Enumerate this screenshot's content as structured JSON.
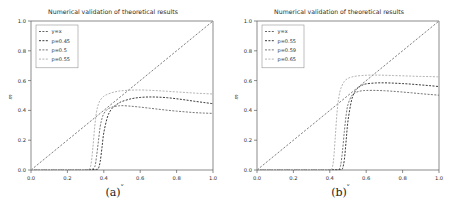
{
  "figure": {
    "panels": [
      {
        "id": "panel-a",
        "caption": "(a)",
        "title": "Numerical validation of theoretical results",
        "xlabel": "x",
        "ylabel": "m"
      },
      {
        "id": "panel-b",
        "caption": "(b)",
        "title": "Numerical validation of theoretical results",
        "xlabel": "x",
        "ylabel": "m"
      }
    ]
  },
  "axis": {
    "xticks": [
      "0.0",
      "0.2",
      "0.4",
      "0.6",
      "0.8",
      "1.0"
    ],
    "yticks": [
      "0.0",
      "0.2",
      "0.4",
      "0.6",
      "0.8",
      "1.0"
    ],
    "xlim": [
      0.0,
      1.0
    ],
    "ylim": [
      0.0,
      1.0
    ]
  },
  "colors": {
    "identity": "#555555",
    "series_dark": "#222222",
    "series_mid": "#666666",
    "series_light": "#aaaaaa",
    "spine": "#5a5a5a",
    "text": "#2b2b2b",
    "background": "#ffffff"
  },
  "chart_data": [
    {
      "type": "line",
      "title": "Numerical validation of theoretical results",
      "xlabel": "x",
      "ylabel": "m",
      "xlim": [
        0.0,
        1.0
      ],
      "ylim": [
        0.0,
        1.0
      ],
      "grid": false,
      "legend_position": "upper left",
      "xticks": [
        0.0,
        0.2,
        0.4,
        0.6,
        0.8,
        1.0
      ],
      "yticks": [
        0.0,
        0.2,
        0.4,
        0.6,
        0.8,
        1.0
      ],
      "series": [
        {
          "name": "y=x",
          "style": "dashed",
          "color": "#555555",
          "x": [
            0.0,
            1.0
          ],
          "y": [
            0.0,
            1.0
          ]
        },
        {
          "name": "p=0.45",
          "style": "dashed",
          "color": "#222222",
          "x": [
            0.0,
            0.05,
            0.1,
            0.15,
            0.2,
            0.25,
            0.3,
            0.34,
            0.36,
            0.37,
            0.38,
            0.39,
            0.4,
            0.42,
            0.44,
            0.46,
            0.48,
            0.5,
            0.55,
            0.6,
            0.65,
            0.7,
            0.75,
            0.8,
            0.85,
            0.9,
            0.95,
            1.0
          ],
          "y": [
            0.003,
            0.003,
            0.003,
            0.003,
            0.003,
            0.003,
            0.003,
            0.003,
            0.004,
            0.01,
            0.055,
            0.15,
            0.25,
            0.355,
            0.405,
            0.43,
            0.447,
            0.46,
            0.478,
            0.487,
            0.49,
            0.489,
            0.485,
            0.478,
            0.47,
            0.461,
            0.453,
            0.445
          ]
        },
        {
          "name": "p=0.5",
          "style": "dashed",
          "color": "#666666",
          "x": [
            0.0,
            0.05,
            0.1,
            0.15,
            0.2,
            0.25,
            0.3,
            0.33,
            0.35,
            0.36,
            0.37,
            0.38,
            0.39,
            0.4,
            0.42,
            0.44,
            0.46,
            0.48,
            0.5,
            0.55,
            0.6,
            0.65,
            0.7,
            0.75,
            0.8,
            0.85,
            0.9,
            0.95,
            1.0
          ],
          "y": [
            0.003,
            0.003,
            0.003,
            0.003,
            0.003,
            0.003,
            0.003,
            0.004,
            0.02,
            0.09,
            0.19,
            0.29,
            0.345,
            0.378,
            0.408,
            0.42,
            0.427,
            0.43,
            0.432,
            0.428,
            0.422,
            0.415,
            0.408,
            0.401,
            0.395,
            0.39,
            0.385,
            0.382,
            0.38
          ]
        },
        {
          "name": "p=0.55",
          "style": "dashed",
          "color": "#aaaaaa",
          "x": [
            0.0,
            0.05,
            0.1,
            0.15,
            0.2,
            0.25,
            0.3,
            0.32,
            0.33,
            0.34,
            0.35,
            0.36,
            0.37,
            0.38,
            0.4,
            0.42,
            0.44,
            0.46,
            0.48,
            0.5,
            0.55,
            0.6,
            0.65,
            0.7,
            0.75,
            0.8,
            0.85,
            0.9,
            0.95,
            1.0
          ],
          "y": [
            0.003,
            0.003,
            0.003,
            0.003,
            0.003,
            0.003,
            0.003,
            0.005,
            0.04,
            0.15,
            0.29,
            0.39,
            0.44,
            0.468,
            0.495,
            0.508,
            0.517,
            0.524,
            0.529,
            0.532,
            0.536,
            0.537,
            0.535,
            0.532,
            0.528,
            0.524,
            0.52,
            0.516,
            0.513,
            0.51
          ]
        }
      ]
    },
    {
      "type": "line",
      "title": "Numerical validation of theoretical results",
      "xlabel": "x",
      "ylabel": "m",
      "xlim": [
        0.0,
        1.0
      ],
      "ylim": [
        0.0,
        1.0
      ],
      "grid": false,
      "legend_position": "upper left",
      "xticks": [
        0.0,
        0.2,
        0.4,
        0.6,
        0.8,
        1.0
      ],
      "yticks": [
        0.0,
        0.2,
        0.4,
        0.6,
        0.8,
        1.0
      ],
      "series": [
        {
          "name": "y=x",
          "style": "dashed",
          "color": "#555555",
          "x": [
            0.0,
            1.0
          ],
          "y": [
            0.0,
            1.0
          ]
        },
        {
          "name": "p=0.55",
          "style": "dashed",
          "color": "#222222",
          "x": [
            0.0,
            0.1,
            0.2,
            0.3,
            0.4,
            0.44,
            0.46,
            0.47,
            0.48,
            0.49,
            0.5,
            0.52,
            0.54,
            0.56,
            0.58,
            0.6,
            0.65,
            0.7,
            0.75,
            0.8,
            0.85,
            0.9,
            0.95,
            1.0
          ],
          "y": [
            0.003,
            0.003,
            0.003,
            0.003,
            0.003,
            0.003,
            0.004,
            0.01,
            0.07,
            0.2,
            0.33,
            0.47,
            0.53,
            0.556,
            0.57,
            0.578,
            0.584,
            0.585,
            0.583,
            0.58,
            0.576,
            0.571,
            0.566,
            0.56
          ]
        },
        {
          "name": "p=0.59",
          "style": "dashed",
          "color": "#666666",
          "x": [
            0.0,
            0.1,
            0.2,
            0.3,
            0.4,
            0.43,
            0.45,
            0.46,
            0.47,
            0.48,
            0.49,
            0.5,
            0.52,
            0.54,
            0.56,
            0.58,
            0.6,
            0.65,
            0.7,
            0.75,
            0.8,
            0.85,
            0.9,
            0.95,
            1.0
          ],
          "y": [
            0.003,
            0.003,
            0.003,
            0.003,
            0.003,
            0.003,
            0.005,
            0.035,
            0.13,
            0.26,
            0.37,
            0.44,
            0.498,
            0.518,
            0.528,
            0.532,
            0.534,
            0.534,
            0.532,
            0.528,
            0.523,
            0.518,
            0.512,
            0.507,
            0.502
          ]
        },
        {
          "name": "p=0.65",
          "style": "dashed",
          "color": "#aaaaaa",
          "x": [
            0.0,
            0.1,
            0.2,
            0.3,
            0.4,
            0.41,
            0.42,
            0.43,
            0.44,
            0.45,
            0.46,
            0.48,
            0.5,
            0.52,
            0.55,
            0.6,
            0.65,
            0.7,
            0.75,
            0.8,
            0.85,
            0.9,
            0.95,
            1.0
          ],
          "y": [
            0.003,
            0.003,
            0.003,
            0.003,
            0.003,
            0.005,
            0.06,
            0.22,
            0.39,
            0.49,
            0.545,
            0.595,
            0.615,
            0.624,
            0.631,
            0.636,
            0.637,
            0.636,
            0.634,
            0.632,
            0.63,
            0.628,
            0.627,
            0.625
          ]
        }
      ]
    }
  ]
}
